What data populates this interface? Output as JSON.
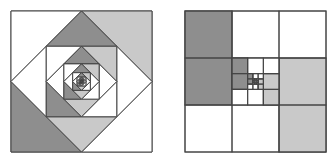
{
  "figures": [
    {
      "id": "nested-rotated-squares",
      "frame": {
        "x": 11,
        "y": 11,
        "size": 141
      },
      "levels": 8,
      "colors": {
        "dark": "#8e8e8e",
        "light": "#c9c9c9",
        "white": "#ffffff",
        "stroke": "#444444"
      }
    },
    {
      "id": "recursive-grid",
      "frame": {
        "x": 185,
        "y": 11,
        "size": 141
      },
      "levels": 4,
      "colors": {
        "dark": "#8e8e8e",
        "light": "#c9c9c9",
        "white": "#ffffff",
        "stroke": "#444444"
      }
    }
  ]
}
